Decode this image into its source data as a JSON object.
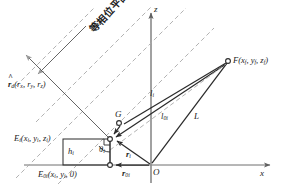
{
  "figure": {
    "background_color": "#ffffff",
    "width": 283,
    "height": 193
  },
  "colors": {
    "axis": "#6e6e6e",
    "solid_line": "#2b2b2b",
    "dashed_line": "#a9a9a9",
    "text": "#1a1a1a",
    "marker_stroke": "#2b2b2b",
    "marker_fill": "#ffffff"
  },
  "axes": {
    "z_label": "z",
    "x_label": "x",
    "origin_label": "O"
  },
  "annotations": {
    "plane_label": "等相位平面",
    "unit_vector": {
      "symbol": "r",
      "sub": "d",
      "components": "(r",
      "comp_x_sub": "x",
      "comp_y": ", r",
      "comp_y_sub": "y",
      "comp_z": ", r",
      "comp_z_sub": "z",
      "close": ")"
    },
    "focal_point": {
      "symbol": "F",
      "coords_open": "(x",
      "sub_f1": "f",
      "coords_mid1": ", y",
      "sub_f2": "f",
      "coords_mid2": ", z",
      "sub_f3": "f",
      "coords_close": ")"
    },
    "element_point": {
      "symbol": "E",
      "sub": "i",
      "coords_open": "(x",
      "sub_i1": "i",
      "coords_mid1": ", y",
      "sub_i2": "i",
      "coords_mid2": ", z",
      "sub_i3": "i",
      "coords_close": ")"
    },
    "element_projection": {
      "symbol": "E",
      "sub": "0i",
      "coords_open": "(x",
      "sub_i1": "i",
      "coords_mid1": ", y",
      "sub_i2": "i",
      "coords_mid2": ", 0",
      "coords_close": ")"
    },
    "point_g": "G",
    "height": {
      "symbol": "h",
      "sub": "i"
    },
    "angle": {
      "symbol": "θ",
      "sub": "i"
    },
    "radius_i": {
      "symbol": "r",
      "sub": "i"
    },
    "radius_0i": {
      "symbol": "r",
      "sub": "0i"
    },
    "path_li": {
      "symbol": "l",
      "sub": "i"
    },
    "path_l0i": {
      "symbol": "l",
      "sub": "0i"
    },
    "path_L": {
      "symbol": "L",
      "sub": ""
    }
  },
  "geometry": {
    "origin": {
      "x": 151,
      "y": 165
    },
    "focal_point": {
      "x": 228,
      "y": 61
    },
    "element_point": {
      "x": 110,
      "y": 139
    },
    "element_projection": {
      "x": 110,
      "y": 165
    },
    "point_g": {
      "x": 119,
      "y": 122
    },
    "x_axis_end": {
      "x": 272,
      "y": 165
    },
    "z_axis_top": {
      "x": 151,
      "y": 11
    }
  }
}
